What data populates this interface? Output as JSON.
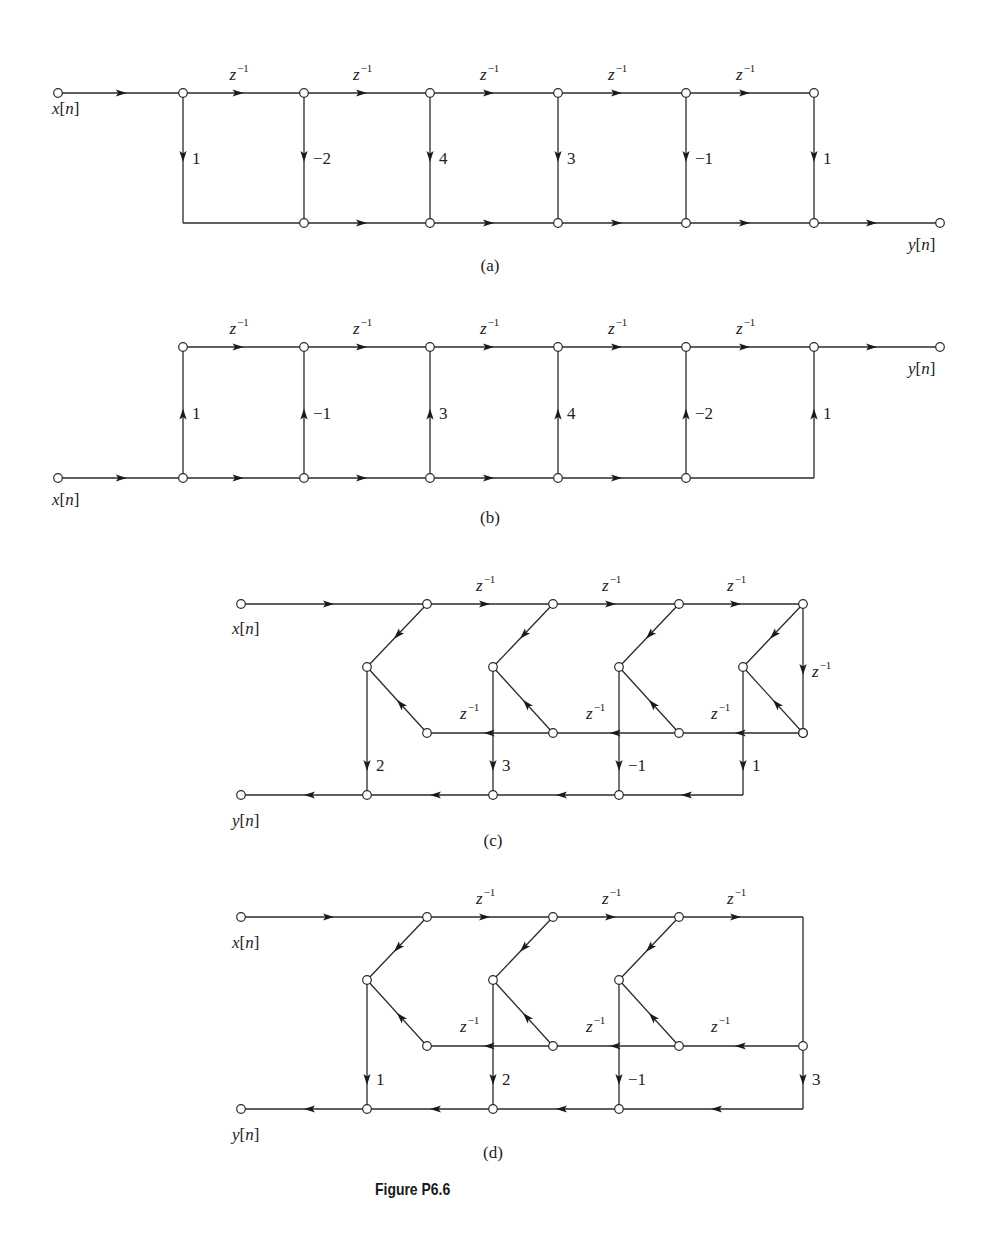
{
  "figure": {
    "caption": "Figure P6.6",
    "delay_label": {
      "base": "z",
      "exp": "−1"
    },
    "input_label": "x[n]",
    "output_label": "y[n]"
  },
  "diagrams": [
    {
      "id": "a",
      "sublabel": "(a)",
      "sublabel_pos": [
        490,
        271
      ],
      "type": "direct-form-transposed-ladder",
      "description": "FIR direct form: tapped delay line on top, taps down to summing line at bottom",
      "top_y": 93,
      "bottom_y": 223,
      "input": {
        "x": 58,
        "y": 93,
        "label": "x[n]",
        "label_pos": [
          52,
          114
        ]
      },
      "output": {
        "x": 940,
        "y": 223,
        "label": "y[n]",
        "label_pos": [
          908,
          250
        ]
      },
      "columns": [
        183,
        304,
        430,
        558,
        686,
        814
      ],
      "delays": [
        "z^-1",
        "z^-1",
        "z^-1",
        "z^-1",
        "z^-1"
      ],
      "taps": [
        "1",
        "−2",
        "4",
        "3",
        "−1",
        "1"
      ],
      "tap_direction": "down"
    },
    {
      "id": "b",
      "sublabel": "(b)",
      "sublabel_pos": [
        490,
        523
      ],
      "type": "transposed-direct-form",
      "description": "Input on bottom line, taps up into top delay chain, output at top right",
      "top_y": 347,
      "bottom_y": 478,
      "input": {
        "x": 58,
        "y": 478,
        "label": "x[n]",
        "label_pos": [
          52,
          505
        ]
      },
      "output": {
        "x": 940,
        "y": 347,
        "label": "y[n]",
        "label_pos": [
          908,
          374
        ]
      },
      "columns": [
        183,
        304,
        430,
        558,
        686,
        814
      ],
      "delays": [
        "z^-1",
        "z^-1",
        "z^-1",
        "z^-1",
        "z^-1"
      ],
      "taps": [
        "1",
        "−1",
        "3",
        "4",
        "−2",
        "1"
      ],
      "tap_direction": "up"
    },
    {
      "id": "c",
      "sublabel": "(c)",
      "sublabel_pos": [
        493,
        846
      ],
      "type": "folded-linear-phase",
      "description": "Linear-phase folded structure with 4 taps and a z^-1 turn-around",
      "top_y": 604,
      "mid_y": 667,
      "low_y": 733,
      "out_y": 795,
      "input": {
        "x": 241,
        "y": 604,
        "label": "x[n]",
        "label_pos": [
          232,
          634
        ]
      },
      "output": {
        "x": 241,
        "y": 795,
        "label": "y[n]",
        "label_pos": [
          232,
          826
        ]
      },
      "top_nodes": [
        427,
        553,
        679,
        803
      ],
      "mid_nodes": [
        367,
        493,
        619,
        743
      ],
      "top_delays": [
        "z^-1",
        "z^-1",
        "z^-1"
      ],
      "low_delays": [
        "z^-1",
        "z^-1",
        "z^-1"
      ],
      "turn_delay": "z^-1",
      "taps": [
        "2",
        "3",
        "−1",
        "1"
      ]
    },
    {
      "id": "d",
      "sublabel": "(d)",
      "sublabel_pos": [
        493,
        1158
      ],
      "type": "folded-linear-phase-odd",
      "description": "Folded structure with 3 pre-adders and a center tap of 3",
      "top_y": 917,
      "mid_y": 980,
      "low_y": 1046,
      "out_y": 1109,
      "input": {
        "x": 241,
        "y": 917,
        "label": "x[n]",
        "label_pos": [
          232,
          948
        ]
      },
      "output": {
        "x": 241,
        "y": 1109,
        "label": "y[n]",
        "label_pos": [
          232,
          1140
        ]
      },
      "top_nodes": [
        427,
        553,
        679
      ],
      "mid_nodes": [
        367,
        493,
        619
      ],
      "right_x": 803,
      "top_delays": [
        "z^-1",
        "z^-1",
        "z^-1"
      ],
      "low_delays": [
        "z^-1",
        "z^-1",
        "z^-1"
      ],
      "taps": [
        "1",
        "2",
        "−1",
        "3"
      ]
    }
  ]
}
